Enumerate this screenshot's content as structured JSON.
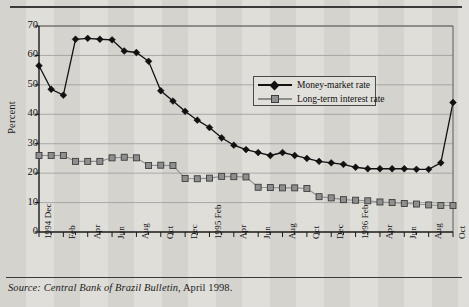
{
  "figure": {
    "source_prefix": "Source:",
    "source_text": " Central Bank of Brazil Bulletin",
    "source_suffix": ", April 1998."
  },
  "legend": {
    "position": "inside-upper-right",
    "entries": [
      {
        "label": "Money-market rate",
        "marker": "diamond-marker-icon",
        "color": "#111111"
      },
      {
        "label": "Long-term interest rate",
        "marker": "square-marker-icon",
        "color": "#8f8f8f"
      }
    ]
  },
  "chart_data": {
    "type": "line",
    "title": "",
    "subtitle": "",
    "xlabel": "",
    "ylabel": "Percent",
    "ylim": [
      0,
      70
    ],
    "yticks": [
      0,
      10,
      20,
      30,
      40,
      50,
      60,
      70
    ],
    "grid": true,
    "legend_position": "inside-upper-right",
    "x": [
      "1994 Dec",
      "Jan",
      "Feb",
      "Mar",
      "Apr",
      "May",
      "Jun",
      "Jul",
      "Aug",
      "Sep",
      "Oct",
      "Nov",
      "Dec",
      "1995 Feb",
      "Mar",
      "Apr",
      "May",
      "Jun",
      "Jul",
      "Aug",
      "Sep",
      "Oct",
      "Nov",
      "Dec",
      "Jan",
      "1996 Feb",
      "Mar",
      "Apr",
      "May",
      "Jun",
      "Jul",
      "Aug",
      "Sep",
      "Oct",
      "Nov"
    ],
    "xtick_labels": [
      {
        "text": "1994 Dec",
        "index": 0
      },
      {
        "text": "Feb",
        "index": 2
      },
      {
        "text": "Apr",
        "index": 4
      },
      {
        "text": "Jun",
        "index": 6
      },
      {
        "text": "Aug",
        "index": 8
      },
      {
        "text": "Oct",
        "index": 10
      },
      {
        "text": "Dec",
        "index": 12
      },
      {
        "text": "1995 Feb",
        "index": 14
      },
      {
        "text": "Apr",
        "index": 16
      },
      {
        "text": "Jun",
        "index": 18
      },
      {
        "text": "Aug",
        "index": 20
      },
      {
        "text": "Oct",
        "index": 22
      },
      {
        "text": "Dec",
        "index": 24
      },
      {
        "text": "1996 Feb",
        "index": 26
      },
      {
        "text": "Apr",
        "index": 28
      },
      {
        "text": "Jun",
        "index": 30
      },
      {
        "text": "Aug",
        "index": 32
      },
      {
        "text": "Oct",
        "index": 34
      }
    ],
    "series": [
      {
        "name": "Money-market rate",
        "color": "#111111",
        "marker": "diamond",
        "values": [
          56.5,
          48.5,
          46.5,
          65.5,
          65.8,
          65.5,
          65.3,
          61.5,
          61.0,
          58.0,
          48.0,
          44.5,
          41.0,
          38.0,
          35.5,
          32.0,
          29.5,
          28.0,
          27.0,
          26.0,
          27.0,
          26.0,
          25.0,
          24.0,
          23.5,
          23.0,
          22.0,
          21.5,
          21.5,
          21.5,
          21.5,
          21.3,
          21.3,
          23.5,
          44.0
        ]
      },
      {
        "name": "Long-term interest rate",
        "color": "#8f8f8f",
        "marker": "square",
        "values": [
          26.0,
          26.0,
          26.0,
          24.0,
          24.0,
          24.0,
          25.2,
          25.4,
          25.2,
          22.6,
          22.7,
          22.6,
          18.2,
          18.1,
          18.3,
          18.9,
          18.8,
          18.7,
          15.2,
          15.1,
          15.0,
          15.0,
          14.8,
          12.0,
          11.6,
          11.0,
          10.8,
          10.6,
          10.2,
          10.0,
          9.7,
          9.5,
          9.2,
          9.0,
          9.0
        ]
      }
    ]
  }
}
